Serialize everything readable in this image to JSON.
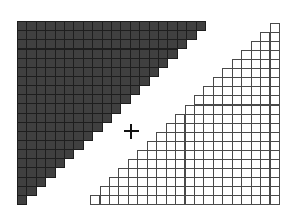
{
  "diagram": {
    "grid": {
      "rows": 20,
      "cols": 20
    },
    "dark_triangle": {
      "fill": "#404040",
      "line": "#1e1e1e",
      "orientation": "upper-left",
      "origin_x": 17,
      "origin_y": 21,
      "cell_w": 9.4,
      "cell_h": 9.15
    },
    "light_triangle": {
      "fill": "#ffffff",
      "line": "#4a4a4a",
      "orientation": "lower-right",
      "right_x": 279,
      "origin_y": 23,
      "cell_w": 9.45,
      "cell_h": 9.05
    },
    "operator": {
      "symbol": "+",
      "center_x": 131,
      "center_y": 131
    }
  }
}
